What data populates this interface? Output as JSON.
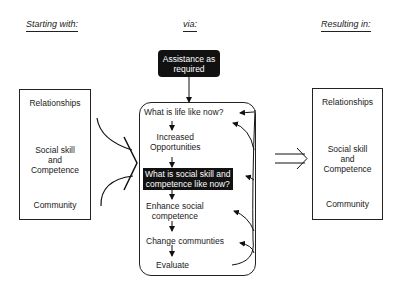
{
  "headers": {
    "starting": "Starting with:",
    "via": "via:",
    "resulting": "Resulting in:"
  },
  "assistance_box": {
    "line1": "Assistance as",
    "line2": "required"
  },
  "left_box": {
    "items": [
      {
        "lines": [
          "Relationships"
        ]
      },
      {
        "lines": [
          "Social skill",
          "and",
          "Competence"
        ]
      },
      {
        "lines": [
          "Community"
        ]
      }
    ]
  },
  "process_steps": [
    {
      "lines": [
        "What is life like now?"
      ],
      "highlighted": false
    },
    {
      "lines": [
        "Increased",
        "Opportunities"
      ],
      "highlighted": false
    },
    {
      "lines": [
        "What is social skill and",
        "competence like now?"
      ],
      "highlighted": true
    },
    {
      "lines": [
        "Enhance social",
        "competence"
      ],
      "highlighted": false
    },
    {
      "lines": [
        "Change communties"
      ],
      "highlighted": false
    },
    {
      "lines": [
        "Evaluate"
      ],
      "highlighted": false
    }
  ],
  "right_box": {
    "items": [
      {
        "lines": [
          "Relationships"
        ]
      },
      {
        "lines": [
          "Social skill",
          "and",
          "Competence"
        ]
      },
      {
        "lines": [
          "Community"
        ]
      }
    ]
  },
  "colors": {
    "ink": "#111111",
    "background": "#ffffff"
  }
}
